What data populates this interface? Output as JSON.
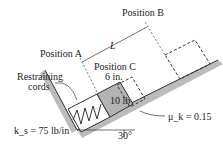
{
  "labels": {
    "position_a": "Position A",
    "position_b": "Position B",
    "position_c": "Position C",
    "length": "L",
    "offset": "6 in.",
    "restraining": "Restraining",
    "cords": "cords",
    "weight": "10 lb",
    "angle": "30°",
    "spring": "k_s = 75 lb/in",
    "friction": "μ_k = 0.15"
  },
  "colors": {
    "block": "#b3b3b3",
    "surface": "#999999",
    "line": "#333333"
  }
}
